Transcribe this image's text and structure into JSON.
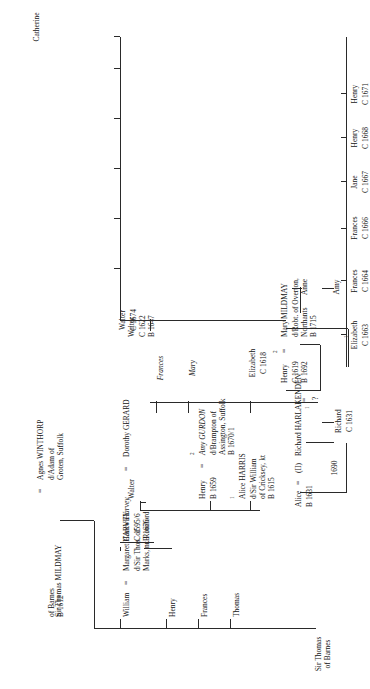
{
  "document": {
    "kind": "genealogical-pedigree-chart",
    "orientation": "rotated-90-ccw",
    "root_label": "Sir Thomas\nof Barnes"
  },
  "generation1": {
    "person": "Sir Thomas MILDMAY",
    "marriage_sign": "=",
    "spouse": "Agnes WINTHORP",
    "spouse_detail": "d/Adam of\nGroten, Suffolk",
    "person_detail": "of Barnes\nB 1612"
  },
  "generation2": {
    "william": {
      "name": "William",
      "marriage_sign": "=",
      "spouse": "Margaret HARVEY",
      "spouse_detail": "d/Sir Thos. of\nMarks, nr. Romford"
    },
    "henry": {
      "name": "Henry"
    },
    "frances": {
      "name": "Frances"
    },
    "thomas": {
      "name": "Thomas"
    },
    "alice_harris": {
      "ordinal": "1",
      "name": "Alice HARRIS",
      "detail": "d/Sir William\nof Cricksey, kt\nB 1615"
    },
    "henry2": {
      "name": "Henry",
      "detail": "B 1659",
      "marriage_sign": "="
    },
    "amy_gurdon": {
      "ordinal": "2",
      "name": "Amy GURDON",
      "detail": "d/Brampton of\nAssington, Suffolk\nB 1670/1"
    },
    "walter": {
      "name": "Walter"
    }
  },
  "generation3": {
    "carew_harvey": {
      "name": "Carew Harvey",
      "marriage_sign": "=",
      "spouse": "Dorothy GERARD",
      "detail": "C 1595/6\nB 1676"
    },
    "elizabeth": {
      "name": "Elizabeth",
      "detail": "C 1618"
    },
    "mary": {
      "name": "Mary"
    },
    "frances": {
      "name": "Frances"
    },
    "henry_c1619": {
      "name": "Henry",
      "detail": "C 1619\nB 1692",
      "ordinal_left": "1",
      "ordinal_right": "2",
      "eq_left": "=",
      "eq_right": "=",
      "first_wife_mark": "?"
    },
    "mary_mildmay": {
      "name": "Mary MILDMAY",
      "detail": "d/Robt. of Overton,\nNorthants\nB 1715"
    },
    "walter_c1622": {
      "name": "Walter",
      "detail": "C 1622\nB 1647"
    },
    "catherine": {
      "name": "Catherine"
    }
  },
  "generation4": {
    "alice": {
      "name": "Alice",
      "marriage_sign": "=",
      "spouse_prefix": "(II)",
      "spouse": "Richard HARLAKENDEN",
      "detail": "B 1631",
      "marriage_year": "1690"
    },
    "richard": {
      "name": "Richard",
      "detail": "C 1631"
    },
    "amy": {
      "name": "Amy"
    },
    "anne": {
      "name": "Anne"
    },
    "children": [
      {
        "name": "Elizabeth",
        "detail": "C 1663",
        "ordinal": "1"
      },
      {
        "name": "Frances",
        "detail": "C 1664"
      },
      {
        "name": "Frances",
        "detail": "C 1666"
      },
      {
        "name": "Jane",
        "detail": "C 1667"
      },
      {
        "name": "Henry",
        "detail": "C 1668"
      },
      {
        "name": "Henry",
        "detail": "C 1671"
      },
      {
        "name": "Walter",
        "detail": "C 1674"
      },
      {
        "name": "Thomas",
        "detail": "C 1675"
      },
      {
        "name": "Mary",
        "detail": ""
      },
      {
        "name": "Lucy",
        "detail": ""
      },
      {
        "name": "Catherine",
        "detail": ""
      }
    ]
  },
  "colors": {
    "ink": "#141414",
    "line": "#2a2a2a",
    "paper": "#ffffff"
  }
}
